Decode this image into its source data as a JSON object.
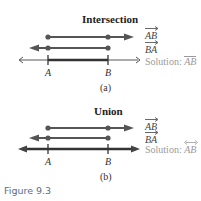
{
  "figure": {
    "caption": "Figure 9.3",
    "colors": {
      "ray": "#555555",
      "line": "#333333",
      "solution_text": "#9a9a9a",
      "caption": "#5a6e86"
    }
  },
  "panels": [
    {
      "title": "Intersection",
      "sublabel": "(a)",
      "rays": [
        {
          "label": "AB",
          "symbol": "ray-right",
          "from": "A",
          "direction": "right"
        },
        {
          "label": "BA",
          "symbol": "ray-left",
          "from": "B",
          "direction": "left"
        }
      ],
      "solution": {
        "prefix": "Solution:",
        "label": "AB",
        "symbol": "segment"
      },
      "points": [
        {
          "label": "A"
        },
        {
          "label": "B"
        }
      ]
    },
    {
      "title": "Union",
      "sublabel": "(b)",
      "rays": [
        {
          "label": "AB",
          "symbol": "ray-right",
          "from": "A",
          "direction": "right"
        },
        {
          "label": "BA",
          "symbol": "ray-left",
          "from": "B",
          "direction": "left"
        }
      ],
      "solution": {
        "prefix": "Solution:",
        "label": "AB",
        "symbol": "line"
      },
      "points": [
        {
          "label": "A"
        },
        {
          "label": "B"
        }
      ]
    }
  ]
}
